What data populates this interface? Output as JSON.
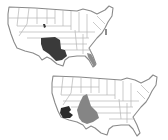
{
  "figure": {
    "panels": [
      {
        "name": "top-map",
        "region": "contiguous-united-states",
        "highlights": [
          {
            "name": "southwest-texas-newmexico",
            "shade": "dark",
            "color": "#3a3a3a"
          },
          {
            "name": "colorado-spot",
            "shade": "dark",
            "color": "#3a3a3a"
          },
          {
            "name": "florida-peninsula",
            "shade": "light",
            "color": "#8c8c8c"
          },
          {
            "name": "mid-atlantic-spot",
            "shade": "light",
            "color": "#8c8c8c"
          }
        ]
      },
      {
        "name": "bottom-map",
        "region": "contiguous-united-states",
        "highlights": [
          {
            "name": "southern-arizona",
            "shade": "dark",
            "color": "#2a2a2a"
          },
          {
            "name": "new-mexico-west-texas",
            "shade": "medium",
            "color": "#858585"
          }
        ]
      }
    ],
    "colors": {
      "background": "#ffffff",
      "outline": "#8a8a8a",
      "state_borders": "#b4b4b4"
    }
  }
}
